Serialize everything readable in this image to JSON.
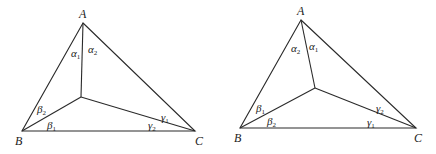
{
  "figures": [
    {
      "id": "left",
      "vertices": {
        "A": "A",
        "B": "B",
        "C": "C"
      },
      "angles": {
        "alpha_left": {
          "greek": "α",
          "sub": "1"
        },
        "alpha_right": {
          "greek": "α",
          "sub": "2"
        },
        "beta_upper": {
          "greek": "β",
          "sub": "2"
        },
        "beta_lower": {
          "greek": "β",
          "sub": "1"
        },
        "gamma_upper": {
          "greek": "γ",
          "sub": "1"
        },
        "gamma_lower": {
          "greek": "γ",
          "sub": "2"
        }
      }
    },
    {
      "id": "right",
      "vertices": {
        "A": "A",
        "B": "B",
        "C": "C"
      },
      "angles": {
        "alpha_left": {
          "greek": "α",
          "sub": "2"
        },
        "alpha_right": {
          "greek": "α",
          "sub": "1"
        },
        "beta_upper": {
          "greek": "β",
          "sub": "1"
        },
        "beta_lower": {
          "greek": "β",
          "sub": "2"
        },
        "gamma_upper": {
          "greek": "γ",
          "sub": "2"
        },
        "gamma_lower": {
          "greek": "γ",
          "sub": "1"
        }
      }
    }
  ]
}
